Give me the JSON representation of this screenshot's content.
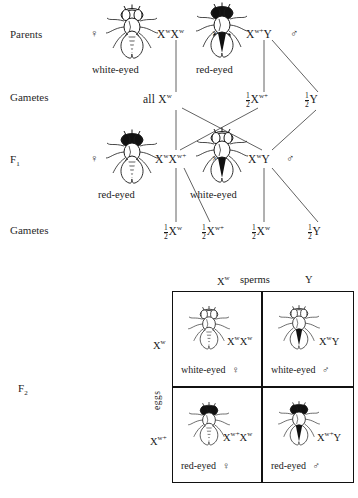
{
  "diagram": {
    "row_labels": {
      "parents": "Parents",
      "gametes_p": "Gametes",
      "f1": "F",
      "f1_sub": "1",
      "gametes_f1": "Gametes",
      "f2": "F",
      "f2_sub": "2"
    },
    "symbols": {
      "female": "♀",
      "male": "♂",
      "cross": "×",
      "allele_X": "X",
      "allele_w": "w",
      "allele_wplus": "w+",
      "allele_Y": "Y"
    },
    "parents": {
      "female": {
        "genotype_text": "XᵛXᵛ",
        "phenotype": "white-eyed",
        "sex": "♀",
        "eye": "white",
        "body": "female"
      },
      "male": {
        "genotype_text": "Xᵛ⁺Y",
        "phenotype": "red-eyed",
        "sex": "♂",
        "eye": "red",
        "body": "male"
      },
      "cross_symbol": "×"
    },
    "gametes_parents": [
      {
        "label": "all X",
        "sup": "w",
        "fraction": null
      },
      {
        "label": "X",
        "sup": "w+",
        "fraction": {
          "n": "1",
          "d": "2"
        }
      },
      {
        "label": "Y",
        "sup": "",
        "fraction": {
          "n": "1",
          "d": "2"
        }
      }
    ],
    "f1": {
      "female": {
        "genotype_text": "XᵛXᵛ⁺",
        "phenotype": "red-eyed",
        "sex": "♀",
        "eye": "red",
        "body": "female"
      },
      "male": {
        "genotype_text": "XᵛY",
        "phenotype": "white-eyed",
        "sex": "♂",
        "eye": "white",
        "body": "male"
      },
      "cross_symbol": "×"
    },
    "gametes_f1": [
      {
        "label": "X",
        "sup": "w",
        "fraction": {
          "n": "1",
          "d": "2"
        }
      },
      {
        "label": "X",
        "sup": "w+",
        "fraction": {
          "n": "1",
          "d": "2"
        }
      },
      {
        "label": "X",
        "sup": "w",
        "fraction": {
          "n": "1",
          "d": "2"
        }
      },
      {
        "label": "Y",
        "sup": "",
        "fraction": {
          "n": "1",
          "d": "2"
        }
      }
    ],
    "punnett": {
      "top_axis_label": "sperms",
      "side_axis_label": "eggs",
      "column_headers": [
        {
          "label": "X",
          "sup": "w"
        },
        {
          "label": "Y",
          "sup": ""
        }
      ],
      "row_headers": [
        {
          "label": "X",
          "sup": "w"
        },
        {
          "label": "X",
          "sup": "w+"
        }
      ],
      "cells": [
        {
          "genotype_text": "XᵛXᵛ",
          "phenotype": "white-eyed",
          "sex": "♀",
          "eye": "white",
          "body": "female"
        },
        {
          "genotype_text": "XᵛY",
          "phenotype": "white-eyed",
          "sex": "♂",
          "eye": "white",
          "body": "male"
        },
        {
          "genotype_text": "Xᵛ⁺Xᵛ",
          "phenotype": "red-eyed",
          "sex": "♀",
          "eye": "red",
          "body": "female"
        },
        {
          "genotype_text": "Xᵛ⁺Y",
          "phenotype": "red-eyed",
          "sex": "♂",
          "eye": "red",
          "body": "male"
        }
      ]
    },
    "colors": {
      "ink": "#1a1a1a",
      "line": "#3a3a3a",
      "background": "#ffffff",
      "dark_eye": "#111111",
      "light_eye": "#ffffff"
    }
  }
}
